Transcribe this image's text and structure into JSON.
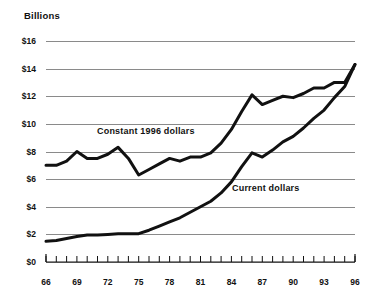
{
  "chart_data": {
    "type": "line",
    "title": "",
    "ylabel": "Billions",
    "xlabel": "",
    "ylim": [
      0,
      16
    ],
    "xlim": [
      66,
      96
    ],
    "grid": true,
    "legend_position": "inline-annotation",
    "y_ticks": [
      "$0",
      "$2",
      "$4",
      "$6",
      "$8",
      "$10",
      "$12",
      "$14",
      "$16"
    ],
    "y_tick_values": [
      0,
      2,
      4,
      6,
      8,
      10,
      12,
      14,
      16
    ],
    "x_ticks_labeled": [
      "66",
      "69",
      "72",
      "75",
      "78",
      "81",
      "84",
      "87",
      "90",
      "93",
      "96"
    ],
    "x_tick_values_labeled": [
      66,
      69,
      72,
      75,
      78,
      81,
      84,
      87,
      90,
      93,
      96
    ],
    "x": [
      66,
      67,
      68,
      69,
      70,
      71,
      72,
      73,
      74,
      75,
      76,
      77,
      78,
      79,
      80,
      81,
      82,
      83,
      84,
      85,
      86,
      87,
      88,
      89,
      90,
      91,
      92,
      93,
      94,
      95,
      96
    ],
    "series": [
      {
        "name": "Constant 1996 dollars",
        "values": [
          7.0,
          7.0,
          7.3,
          8.0,
          7.5,
          7.5,
          7.8,
          8.3,
          7.5,
          6.3,
          6.7,
          7.1,
          7.5,
          7.3,
          7.6,
          7.6,
          7.9,
          8.6,
          9.6,
          10.9,
          12.1,
          11.4,
          11.7,
          12.0,
          11.9,
          12.2,
          12.6,
          12.6,
          13.0,
          13.0,
          14.3
        ]
      },
      {
        "name": "Current dollars",
        "values": [
          1.5,
          1.55,
          1.7,
          1.85,
          1.95,
          1.95,
          2.0,
          2.05,
          2.05,
          2.05,
          2.3,
          2.6,
          2.9,
          3.2,
          3.6,
          4.0,
          4.4,
          5.0,
          5.8,
          6.9,
          7.9,
          7.6,
          8.1,
          8.7,
          9.1,
          9.7,
          10.4,
          11.0,
          11.9,
          12.7,
          14.3
        ]
      }
    ],
    "annotations": [
      {
        "name": "constant-dollars-label",
        "text": "Constant 1996 dollars"
      },
      {
        "name": "current-dollars-label",
        "text": "Current dollars"
      }
    ],
    "colors": {
      "line": "#111111",
      "grid": "#8a8a8a",
      "background": "#ffffff",
      "text": "#111111"
    }
  }
}
